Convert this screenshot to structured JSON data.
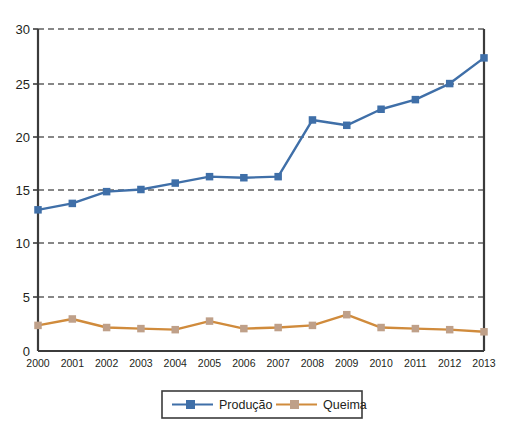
{
  "chart_data": {
    "type": "line",
    "title": "",
    "subtitle": "",
    "xlabel": "",
    "ylabel": "",
    "xlim": [
      2000,
      2013
    ],
    "ylim": [
      0,
      30
    ],
    "yticks": [
      0,
      5,
      10,
      15,
      20,
      25,
      30
    ],
    "grid": "horizontal-dashed",
    "legend_position": "bottom-center",
    "categories": [
      2000,
      2001,
      2002,
      2003,
      2004,
      2005,
      2006,
      2007,
      2008,
      2009,
      2010,
      2011,
      2012,
      2013
    ],
    "x": [
      "2000",
      "2001",
      "2002",
      "2003",
      "2004",
      "2005",
      "2006",
      "2007",
      "2008",
      "2009",
      "2010",
      "2011",
      "2012",
      "2013"
    ],
    "series": [
      {
        "name": "Produção",
        "color": "#3f6fa8",
        "marker": "square",
        "values": [
          13.1,
          13.7,
          14.8,
          15.0,
          15.6,
          16.2,
          16.1,
          16.2,
          21.5,
          21.0,
          22.5,
          23.4,
          24.9,
          27.3
        ]
      },
      {
        "name": "Queima",
        "color": "#d08b3c",
        "marker": "square",
        "values": [
          2.3,
          2.9,
          2.1,
          2.0,
          1.9,
          2.7,
          2.0,
          2.1,
          2.3,
          3.3,
          2.1,
          2.0,
          1.9,
          1.7
        ]
      }
    ]
  },
  "axis": {
    "y_tick_labels": [
      "30",
      "25",
      "20",
      "15",
      "10",
      "5",
      "0"
    ],
    "x_tick_labels": [
      "2000",
      "2001",
      "2002",
      "2003",
      "2004",
      "2005",
      "2006",
      "2007",
      "2008",
      "2009",
      "2010",
      "2011",
      "2012",
      "2013"
    ]
  },
  "legend": {
    "items": [
      {
        "label": "Produção",
        "color": "#3f6fa8"
      },
      {
        "label": "Queima",
        "color": "#d08b3c"
      }
    ]
  },
  "colors": {
    "producao": "#3f6fa8",
    "queima": "#d08b3c",
    "axis": "#3b3b3b",
    "grid": "#111111",
    "background": "#ffffff"
  }
}
